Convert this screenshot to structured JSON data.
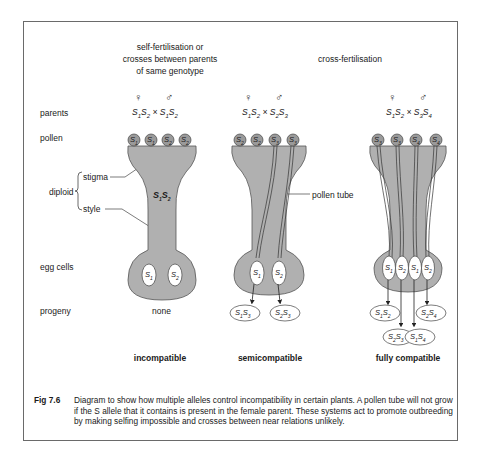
{
  "headings": {
    "self": [
      "self-fertilisation or",
      "crosses between parents",
      "of same genotype"
    ],
    "cross": "cross-fertilisation"
  },
  "row_labels": {
    "parents": "parents",
    "pollen": "pollen",
    "diploid": "diploid",
    "stigma": "stigma",
    "style": "style",
    "egg_cells": "egg cells",
    "progeny": "progeny"
  },
  "symbols": {
    "female": "♀",
    "male": "♂",
    "cross": "×"
  },
  "panels": [
    {
      "id": "incompatible",
      "female_parent": "S1S2",
      "male_parent": "S1S2",
      "pollen": [
        "S1",
        "S1",
        "S2",
        "S2"
      ],
      "style_genotype": "S1S2",
      "egg_cells": [
        "S1",
        "S2"
      ],
      "progeny": [],
      "progeny_text": "none",
      "label": "incompatible"
    },
    {
      "id": "semicompatible",
      "female_parent": "S1S2",
      "male_parent": "S2S3",
      "pollen": [
        "S2",
        "S2",
        "S3",
        "S3"
      ],
      "egg_cells": [
        "S1",
        "S2"
      ],
      "progeny": [
        "S1S3",
        "S2S3"
      ],
      "annotation": "pollen tube",
      "label": "semicompatible"
    },
    {
      "id": "fully-compatible",
      "female_parent": "S1S2",
      "male_parent": "S3S4",
      "pollen": [
        "S3",
        "S3",
        "S4",
        "S4"
      ],
      "egg_cells": [
        "S1",
        "S2",
        "S1",
        "S2"
      ],
      "progeny": [
        "S1S3",
        "S2S4",
        "S2S3",
        "S1S4"
      ],
      "label": "fully compatible"
    }
  ],
  "caption": {
    "fig": "Fig  7.6",
    "text": "Diagram to show how multiple alleles control incompatibility in certain plants. A pollen tube will not grow if the S allele that it contains is present in the female parent. These systems act to promote outbreeding by making selfing impossible and crosses between near relations unlikely."
  },
  "colors": {
    "tissue": "#b0b0b0",
    "outline": "#444444",
    "egg": "#ffffff"
  }
}
